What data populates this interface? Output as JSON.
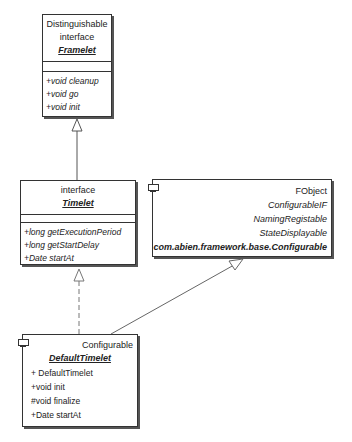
{
  "classes": {
    "framelet": {
      "stereotype1": "Distinguishable",
      "stereotype2": "interface",
      "name": "Framelet",
      "operations": [
        "+void cleanup",
        "+void go",
        "+void init"
      ]
    },
    "timelet": {
      "stereotype": "interface",
      "name": "Timelet",
      "operations": [
        "+long getExecutionPeriod",
        "+long getStartDelay",
        "+Date startAt"
      ]
    },
    "fobject": {
      "lines": [
        "FObject",
        "ConfigurableIF",
        "NamingRegistable",
        "StateDisplayable"
      ],
      "name": "com.abien.framework.base.Configurable"
    },
    "default_timelet": {
      "stereotype": "Configurable",
      "name": "DefaultTimelet",
      "operations": [
        "+ DefaultTimelet",
        "+void init",
        "#void finalize",
        "+Date startAt"
      ]
    }
  },
  "relations": [
    {
      "from": "Timelet",
      "to": "Framelet",
      "type": "generalization"
    },
    {
      "from": "DefaultTimelet",
      "to": "Timelet",
      "type": "realization"
    },
    {
      "from": "DefaultTimelet",
      "to": "com.abien.framework.base.Configurable",
      "type": "generalization"
    }
  ]
}
